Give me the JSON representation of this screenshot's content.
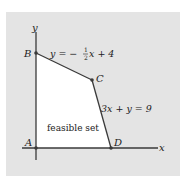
{
  "figure": {
    "type": "linear-programming feasible region",
    "axes": {
      "x_label": "x",
      "y_label": "y"
    },
    "vertices": [
      {
        "name": "A",
        "label": "A"
      },
      {
        "name": "B",
        "label": "B"
      },
      {
        "name": "C",
        "label": "C"
      },
      {
        "name": "D",
        "label": "D"
      }
    ],
    "constraints": [
      {
        "label": "y = −½x + 4",
        "lhs": "y = −",
        "frac_num": "1",
        "frac_den": "2",
        "rhs": "x + 4"
      },
      {
        "label": "3x + y = 9"
      }
    ],
    "region_label": "feasible set",
    "colors": {
      "panel_bg": "#e4e4e4",
      "region_fill": "#ffffff",
      "line": "#3a3a3a",
      "point": "#3a3a3a"
    }
  }
}
